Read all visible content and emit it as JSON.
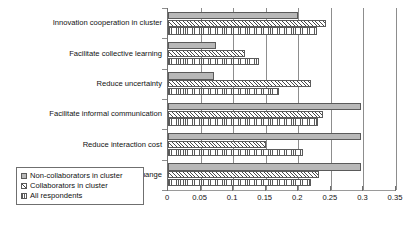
{
  "chart_data": {
    "type": "bar",
    "orientation": "horizontal",
    "title": "",
    "xlabel": "",
    "ylabel": "",
    "xlim": [
      0,
      0.35
    ],
    "xticks": [
      "0",
      "0.05",
      "0.1",
      "0.15",
      "0.2",
      "0.25",
      "0.3",
      "0.35"
    ],
    "xtick_values": [
      0,
      0.05,
      0.1,
      0.15,
      0.2,
      0.25,
      0.3,
      0.35
    ],
    "grid": true,
    "legend_position": "bottom-left",
    "categories": [
      "Innovation cooperation in cluster",
      "Facilitate collective learning",
      "Reduce uncertainty",
      "Facilitate informal communication",
      "Reduce interaction cost",
      "Swifter, clearer knowledge exchange"
    ],
    "series": [
      {
        "name": "Non-collaborators in cluster",
        "pattern": "solid-gray",
        "color": "#b8b8b8",
        "values": [
          0.2,
          0.074,
          0.07,
          0.297,
          0.297,
          0.297
        ]
      },
      {
        "name": "Collaborators in cluster",
        "pattern": "diagonal-hatch",
        "color": "#4a4a4a",
        "values": [
          0.243,
          0.118,
          0.22,
          0.238,
          0.15,
          0.232
        ]
      },
      {
        "name": "All respondents",
        "pattern": "dotted",
        "color": "#5a5a5a",
        "values": [
          0.228,
          0.14,
          0.17,
          0.23,
          0.207,
          0.22
        ]
      }
    ]
  },
  "legend": {
    "items": [
      {
        "label": "Non-collaborators in cluster"
      },
      {
        "label": "Collaborators in cluster"
      },
      {
        "label": "All respondents"
      }
    ]
  }
}
